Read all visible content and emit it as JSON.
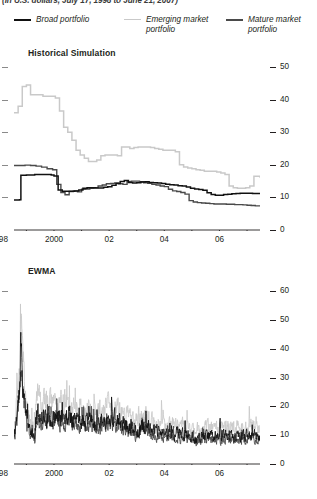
{
  "header": {
    "subtitle": "(In U.S. dollars, July 17, 1998 to June 21, 2007)"
  },
  "legend": {
    "position": "top",
    "items": [
      {
        "label": "Broad portfolio",
        "color": "#111111",
        "width": 2.6
      },
      {
        "label": "Emerging market portfolio",
        "color": "#c9c9c9",
        "width": 1.6
      },
      {
        "label": "Mature market portfolio",
        "color": "#4a4a4a",
        "width": 2.2
      }
    ]
  },
  "chart_data": [
    {
      "type": "line",
      "title": "Historical Simulation",
      "xlabel": "",
      "ylabel": "",
      "ylim": [
        0,
        54
      ],
      "yticks": [
        0,
        10,
        20,
        30,
        40,
        50
      ],
      "xlim": [
        1998.55,
        2007.47
      ],
      "xticks": [
        1998,
        1999,
        2000,
        2001,
        2002,
        2003,
        2004,
        2005,
        2006,
        2007
      ],
      "xticklabels": [
        "1998",
        "",
        "2000",
        "",
        "02",
        "",
        "04",
        "",
        "06",
        ""
      ],
      "grid": false,
      "step": true,
      "series": [
        {
          "name": "Broad portfolio",
          "color": "#111111",
          "width": 1.5,
          "x": [
            1998.55,
            1998.75,
            1998.8,
            1999.0,
            1999.3,
            1999.6,
            1999.9,
            2000.0,
            2000.15,
            2000.3,
            2000.45,
            2000.6,
            2000.75,
            2000.9,
            2001.05,
            2001.2,
            2001.35,
            2001.5,
            2001.65,
            2001.8,
            2001.95,
            2002.1,
            2002.25,
            2002.4,
            2002.55,
            2002.7,
            2002.85,
            2003.0,
            2003.15,
            2003.3,
            2003.45,
            2003.6,
            2003.75,
            2003.9,
            2004.05,
            2004.2,
            2004.35,
            2004.5,
            2004.65,
            2004.8,
            2004.95,
            2005.1,
            2005.25,
            2005.4,
            2005.55,
            2005.7,
            2005.85,
            2006.0,
            2006.15,
            2006.3,
            2006.45,
            2006.6,
            2006.75,
            2006.9,
            2007.05,
            2007.2,
            2007.35,
            2007.47
          ],
          "y": [
            9.2,
            9.3,
            16.8,
            16.9,
            17.0,
            17.0,
            16.9,
            16.6,
            12.3,
            11.9,
            11.9,
            11.9,
            12.0,
            12.3,
            12.8,
            13.0,
            13.0,
            12.9,
            12.9,
            13.1,
            13.3,
            13.7,
            14.3,
            14.9,
            15.2,
            14.6,
            14.4,
            14.5,
            14.7,
            14.8,
            14.6,
            14.5,
            14.4,
            14.3,
            14.0,
            13.9,
            13.8,
            13.6,
            13.5,
            13.2,
            12.8,
            12.6,
            12.4,
            12.2,
            11.4,
            10.9,
            10.7,
            10.7,
            10.9,
            11.0,
            11.1,
            11.2,
            11.3,
            11.3,
            11.3,
            11.2,
            11.2,
            11.2
          ]
        },
        {
          "name": "Emerging market portfolio",
          "color": "#c9c9c9",
          "width": 1.5,
          "x": [
            1998.55,
            1998.7,
            1998.85,
            1999.0,
            1999.15,
            1999.3,
            1999.45,
            1999.6,
            1999.75,
            1999.9,
            2000.05,
            2000.2,
            2000.35,
            2000.5,
            2000.65,
            2000.8,
            2000.95,
            2001.1,
            2001.25,
            2001.4,
            2001.55,
            2001.7,
            2001.85,
            2002.0,
            2002.15,
            2002.3,
            2002.45,
            2002.6,
            2002.75,
            2002.9,
            2003.05,
            2003.2,
            2003.35,
            2003.5,
            2003.65,
            2003.8,
            2003.95,
            2004.1,
            2004.25,
            2004.4,
            2004.55,
            2004.7,
            2004.85,
            2005.0,
            2005.15,
            2005.3,
            2005.45,
            2005.6,
            2005.75,
            2005.9,
            2006.05,
            2006.2,
            2006.35,
            2006.5,
            2006.65,
            2006.8,
            2006.95,
            2007.1,
            2007.25,
            2007.4,
            2007.47
          ],
          "y": [
            36.0,
            38.0,
            44.0,
            44.5,
            41.5,
            41.5,
            41.5,
            41.0,
            41.0,
            41.0,
            40.5,
            36.5,
            31.5,
            30.0,
            27.5,
            24.5,
            23.0,
            22.0,
            21.0,
            21.0,
            21.5,
            22.8,
            23.0,
            23.0,
            23.0,
            22.8,
            25.5,
            25.5,
            25.0,
            25.3,
            25.5,
            25.5,
            25.5,
            25.3,
            25.0,
            24.8,
            24.5,
            24.5,
            24.5,
            24.0,
            20.0,
            19.3,
            19.0,
            18.8,
            18.5,
            18.3,
            18.0,
            18.0,
            18.0,
            17.8,
            17.5,
            17.0,
            13.5,
            13.0,
            12.8,
            12.8,
            13.0,
            13.5,
            16.5,
            16.5,
            16.0
          ]
        },
        {
          "name": "Mature market portfolio",
          "color": "#4a4a4a",
          "width": 1.4,
          "x": [
            1998.55,
            1998.75,
            1998.95,
            1999.15,
            1999.35,
            1999.55,
            1999.75,
            1999.95,
            2000.1,
            2000.25,
            2000.4,
            2000.55,
            2000.7,
            2000.85,
            2001.0,
            2001.15,
            2001.3,
            2001.45,
            2001.6,
            2001.75,
            2001.9,
            2002.05,
            2002.2,
            2002.35,
            2002.5,
            2002.65,
            2002.8,
            2002.95,
            2003.1,
            2003.25,
            2003.4,
            2003.55,
            2003.7,
            2003.85,
            2004.0,
            2004.15,
            2004.3,
            2004.45,
            2004.6,
            2004.75,
            2004.9,
            2005.05,
            2005.2,
            2005.35,
            2005.5,
            2005.65,
            2005.8,
            2005.95,
            2006.1,
            2006.25,
            2006.4,
            2006.55,
            2006.7,
            2006.85,
            2007.0,
            2007.15,
            2007.3,
            2007.47
          ],
          "y": [
            19.8,
            19.8,
            19.9,
            19.8,
            19.6,
            19.3,
            18.8,
            18.5,
            14.0,
            11.5,
            10.8,
            11.8,
            12.0,
            11.7,
            12.5,
            12.6,
            12.8,
            13.0,
            13.5,
            13.8,
            14.2,
            14.3,
            14.4,
            14.2,
            14.0,
            14.8,
            15.0,
            15.0,
            14.8,
            14.5,
            14.3,
            14.0,
            13.8,
            13.5,
            13.3,
            12.5,
            12.0,
            11.8,
            11.5,
            11.0,
            9.0,
            8.6,
            8.4,
            8.3,
            8.2,
            8.1,
            8.0,
            8.0,
            8.0,
            7.9,
            7.9,
            7.8,
            7.8,
            7.7,
            7.6,
            7.5,
            7.4,
            7.3
          ]
        }
      ]
    },
    {
      "type": "line",
      "title": "EWMA",
      "xlabel": "",
      "ylabel": "",
      "ylim": [
        0,
        66
      ],
      "yticks": [
        0,
        10,
        20,
        30,
        40,
        50,
        60
      ],
      "xlim": [
        1998.55,
        2007.47
      ],
      "xticks": [
        1998,
        1999,
        2000,
        2001,
        2002,
        2003,
        2004,
        2005,
        2006,
        2007
      ],
      "xticklabels": [
        "1998",
        "",
        "2000",
        "",
        "02",
        "",
        "04",
        "",
        "06",
        ""
      ],
      "grid": false,
      "step": false,
      "note": "High-frequency volatile series; large spike near 1998 Q4",
      "series": [
        {
          "name": "Broad portfolio",
          "color": "#111111",
          "width": 0.85,
          "peak": 44,
          "baseline_end": 7
        },
        {
          "name": "Emerging market portfolio",
          "color": "#c9c9c9",
          "width": 0.85,
          "peak": 57,
          "baseline_end": 9
        },
        {
          "name": "Mature market portfolio",
          "color": "#4a4a4a",
          "width": 0.85,
          "peak": 40,
          "baseline_end": 6
        }
      ]
    }
  ]
}
